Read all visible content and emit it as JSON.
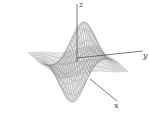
{
  "chart_data": {
    "type": "surface",
    "title": "",
    "function": "z = x * exp(-(x^2 + y^2))",
    "render_style": "wireframe mesh",
    "axes": {
      "x": {
        "label": "x",
        "range": [
          -2,
          2
        ]
      },
      "y": {
        "label": "y",
        "range": [
          -2,
          2
        ]
      },
      "z": {
        "label": "z",
        "range": [
          -0.43,
          0.43
        ]
      }
    },
    "features": [
      {
        "type": "peak",
        "description": "two raised lobes at back"
      },
      {
        "type": "trough",
        "description": "two sunken lobes at front"
      }
    ],
    "grid": false,
    "legend": "none",
    "colors": {
      "mesh": "#8a8a8a",
      "axis": "#444444",
      "background": "#ffffff"
    }
  },
  "labels": {
    "x": "x",
    "y": "y",
    "z": "z"
  }
}
